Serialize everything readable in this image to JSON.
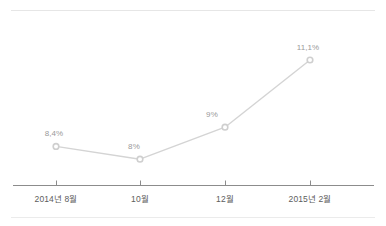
{
  "chart_data": {
    "type": "line",
    "title": "",
    "xlabel": "",
    "ylabel": "",
    "grid": false,
    "legend": false,
    "categories": [
      "2014년 8월",
      "10월",
      "12월",
      "2015년 2월"
    ],
    "values": [
      8.4,
      8.0,
      9.0,
      11.1
    ],
    "point_labels": [
      "8,4%",
      "8%",
      "9%",
      "11,1%"
    ],
    "ylim": [
      7.6,
      11.6
    ],
    "series": [
      {
        "name": "",
        "values": [
          8.4,
          8.0,
          9.0,
          11.1
        ]
      }
    ],
    "colors": {
      "line": "#d4d4d4",
      "marker_fill": "#ffffff",
      "marker_stroke": "#cfcfcf",
      "axis": "#8c8c8c",
      "tick_text": "#5d5d5d",
      "label_text": "#9a9a9a",
      "rule": "#e6e6e6"
    }
  },
  "axis": {
    "ticks": [
      "2014년 8월",
      "10월",
      "12월",
      "2015년 2월"
    ]
  }
}
